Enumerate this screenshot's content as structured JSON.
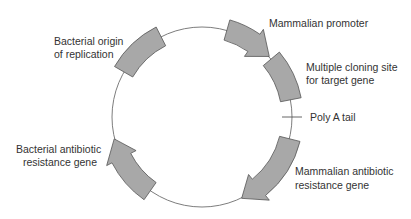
{
  "diagram": {
    "type": "plasmid-map",
    "center": [
      202,
      117
    ],
    "radius": 90,
    "band_inner": 80,
    "band_outer": 101,
    "colors": {
      "segment_fill": "#a8a8a8",
      "segment_stroke": "#555555",
      "backbone": "#6e6e6e",
      "text": "#333333",
      "background": "#ffffff"
    },
    "segments": [
      {
        "id": "bacterial-origin",
        "kind": "block",
        "start_deg": 150,
        "end_deg": 117
      },
      {
        "id": "mammalian-promoter",
        "kind": "arrow",
        "start_deg": 74,
        "end_deg": 42
      },
      {
        "id": "multiple-cloning-site",
        "kind": "block",
        "start_deg": 40,
        "end_deg": 11
      },
      {
        "id": "mammalian-antibiotic",
        "kind": "arrow",
        "start_deg": -14,
        "end_deg": -64
      },
      {
        "id": "bacterial-antibiotic",
        "kind": "arrow",
        "start_deg": -125,
        "end_deg": -166
      }
    ],
    "poly_a_tick_deg": 0,
    "labels": {
      "origin": [
        "Bacterial origin",
        "of replication"
      ],
      "promoter": [
        "Mammalian promoter"
      ],
      "mcs": [
        "Multiple cloning site",
        "for target gene"
      ],
      "poly_a": [
        "Poly A tail"
      ],
      "mammalian_antibiotic": [
        "Mammalian antibiotic",
        "resistance gene"
      ],
      "bacterial_antibiotic": [
        "Bacterial antibiotic",
        "resistance gene"
      ]
    }
  }
}
